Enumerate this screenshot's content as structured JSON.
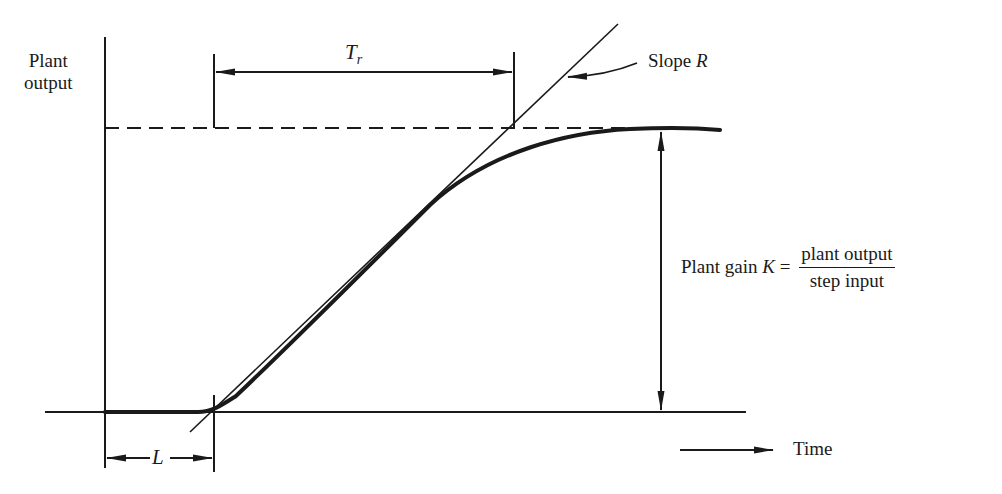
{
  "diagram": {
    "y_axis_label_line1": "Plant",
    "y_axis_label_line2": "output",
    "x_axis_label": "Time",
    "rise_time_label": "T",
    "rise_time_subscript": "r",
    "slope_label_prefix": "Slope ",
    "slope_symbol": "R",
    "dead_time_label": "L",
    "gain_label_prefix": "Plant gain ",
    "gain_symbol": "K",
    "gain_equals": " = ",
    "gain_numerator": "plant output",
    "gain_denominator": "step input",
    "colors": {
      "ink": "#1a1a1a",
      "background": "#ffffff"
    },
    "elements": [
      "vertical-axis",
      "time-baseline",
      "steady-state-dashed-line",
      "response-curve",
      "tangent-line-slope-R",
      "rise-time-dimension-Tr",
      "dead-time-dimension-L",
      "gain-dimension-arrow",
      "time-direction-arrow"
    ]
  }
}
